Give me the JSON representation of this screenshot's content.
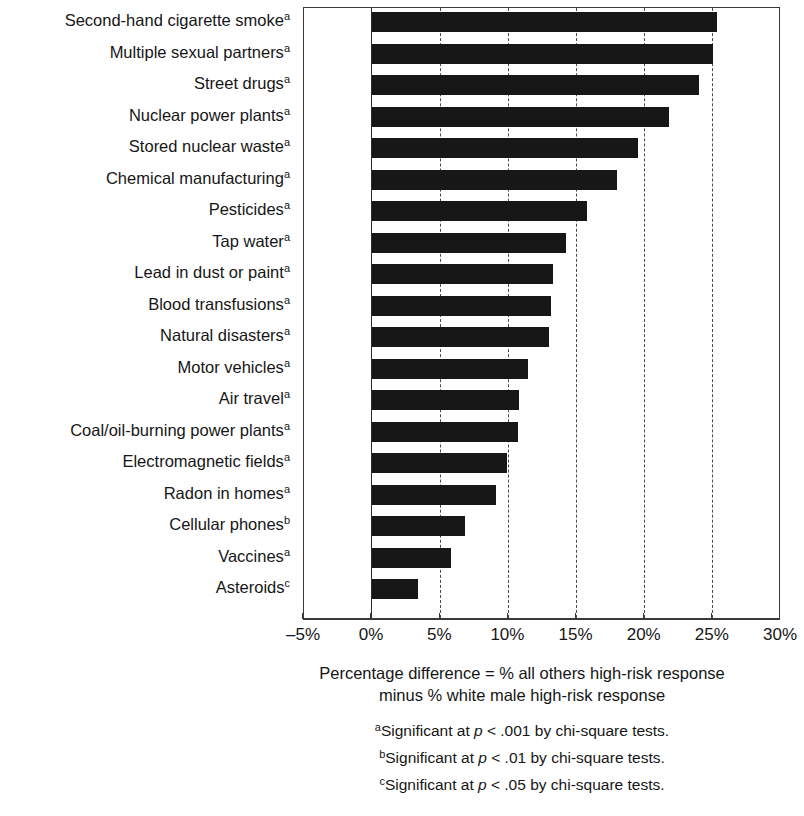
{
  "chart_data": {
    "type": "bar",
    "orientation": "horizontal",
    "title": "",
    "xlabel": "Percentage difference = % all others high-risk response minus % white male high-risk response",
    "ylabel": "",
    "xlim": [
      -5,
      30
    ],
    "xticks": [
      -5,
      0,
      5,
      10,
      15,
      20,
      25,
      30
    ],
    "xtick_labels": [
      "–5%",
      "0%",
      "5%",
      "10%",
      "15%",
      "20%",
      "25%",
      "30%"
    ],
    "grid": "vertical dashed gridlines at every 5% tick; solid baseline at 0%",
    "legend": "none",
    "bar_color": "#171717",
    "categories": [
      "Second-hand cigarette smoke",
      "Multiple sexual partners",
      "Street drugs",
      "Nuclear power plants",
      "Stored nuclear waste",
      "Chemical manufacturing",
      "Pesticides",
      "Tap water",
      "Lead in dust or paint",
      "Blood transfusions",
      "Natural disasters",
      "Motor vehicles",
      "Air travel",
      "Coal/oil-burning power plants",
      "Electromagnetic fields",
      "Radon in homes",
      "Cellular phones",
      "Vaccines",
      "Asteroids"
    ],
    "significance_marks": [
      "a",
      "a",
      "a",
      "a",
      "a",
      "a",
      "a",
      "a",
      "a",
      "a",
      "a",
      "a",
      "a",
      "a",
      "a",
      "a",
      "b",
      "a",
      "c"
    ],
    "values": [
      25.3,
      25.0,
      24.0,
      21.8,
      19.5,
      18.0,
      15.8,
      14.2,
      13.3,
      13.1,
      13.0,
      11.4,
      10.8,
      10.7,
      9.9,
      9.1,
      6.8,
      5.8,
      3.4
    ]
  },
  "axis": {
    "caption_line1": "Percentage difference = % all others high-risk response",
    "caption_line2": "minus % white male high-risk response"
  },
  "footnotes": [
    {
      "mark": "a",
      "pre": "Significant at ",
      "p": "p",
      "post": " < .001 by chi-square tests."
    },
    {
      "mark": "b",
      "pre": "Significant at ",
      "p": "p",
      "post": " < .01 by chi-square tests."
    },
    {
      "mark": "c",
      "pre": "Significant at ",
      "p": "p",
      "post": " < .05 by chi-square tests."
    }
  ]
}
